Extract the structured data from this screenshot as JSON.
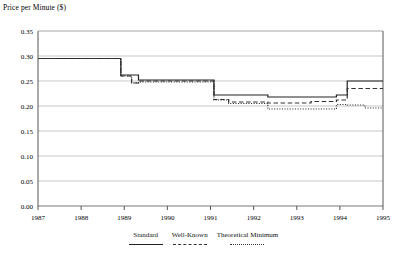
{
  "chart_data": {
    "type": "line",
    "title": "Price per Minute ($)",
    "xlabel": "",
    "ylabel": "Price per Minute ($)",
    "xlim": [
      1987,
      1995
    ],
    "ylim": [
      0.0,
      0.35
    ],
    "ytick_labels": [
      "0.00",
      "0.05",
      "0.10",
      "0.15",
      "0.20",
      "0.25",
      "0.30",
      "0.35"
    ],
    "ytick_values": [
      0.0,
      0.05,
      0.1,
      0.15,
      0.2,
      0.25,
      0.3,
      0.35
    ],
    "xtick_labels": [
      "1987",
      "1988",
      "1989",
      "1990",
      "1991",
      "1992",
      "1993",
      "1994",
      "1995"
    ],
    "xtick_values": [
      1987,
      1988,
      1989,
      1990,
      1991,
      1992,
      1993,
      1994,
      1995
    ],
    "grid": true,
    "legend_position": "bottom",
    "step": "post",
    "series": [
      {
        "name": "Standard",
        "style": "solid",
        "color": "#222222",
        "x": [
          1987.0,
          1987.92,
          1988.92,
          1989.17,
          1989.33,
          1990.0,
          1991.08,
          1991.42,
          1992.33,
          1993.33,
          1993.92,
          1994.17,
          1995.0
        ],
        "values": [
          0.295,
          0.295,
          0.262,
          0.262,
          0.252,
          0.252,
          0.222,
          0.222,
          0.218,
          0.218,
          0.222,
          0.25,
          0.25
        ]
      },
      {
        "name": "Well-Known",
        "style": "dashed",
        "color": "#333333",
        "x": [
          1987.0,
          1987.92,
          1988.92,
          1989.17,
          1989.33,
          1990.0,
          1991.08,
          1991.42,
          1992.33,
          1993.33,
          1993.92,
          1994.17,
          1995.0
        ],
        "values": [
          0.295,
          0.295,
          0.26,
          0.246,
          0.25,
          0.25,
          0.213,
          0.208,
          0.206,
          0.209,
          0.212,
          0.235,
          0.235
        ]
      },
      {
        "name": "Theoretical Minimum",
        "style": "dotted",
        "color": "#333333",
        "x": [
          1987.0,
          1987.92,
          1988.92,
          1989.17,
          1989.33,
          1990.0,
          1991.08,
          1991.42,
          1992.33,
          1993.33,
          1993.92,
          1994.17,
          1994.58,
          1995.0
        ],
        "values": [
          0.295,
          0.295,
          0.26,
          0.246,
          0.248,
          0.248,
          0.212,
          0.205,
          0.194,
          0.194,
          0.203,
          0.202,
          0.196,
          0.196
        ]
      }
    ]
  },
  "legend": {
    "items": [
      {
        "label": "Standard",
        "style": "solid"
      },
      {
        "label": "Well-Known",
        "style": "dashed"
      },
      {
        "label": "Theoretical Minimum",
        "style": "dotted"
      }
    ]
  }
}
